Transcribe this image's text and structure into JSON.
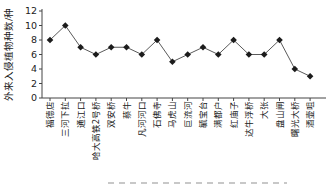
{
  "chart_data": {
    "type": "line",
    "title": "",
    "xlabel": "",
    "ylabel": "外来入侵植物种数/种",
    "categories": [
      "福德店",
      "三河下拉",
      "通江口",
      "哈大高铁2号桥",
      "双安桥",
      "蔡牛",
      "凡河河口",
      "石佛寺",
      "马虎山",
      "巨流河",
      "毓宝台",
      "满都户",
      "红庙子",
      "达牛浮桥",
      "大张",
      "盘山闸",
      "曙光大桥",
      "酒壶咀"
    ],
    "values": [
      8,
      10,
      7,
      6,
      7,
      7,
      6,
      8,
      5,
      6,
      7,
      6,
      8,
      6,
      6,
      8,
      4,
      3
    ],
    "yticks": [
      0,
      2,
      4,
      6,
      8,
      10,
      12
    ],
    "ylim": [
      0,
      12
    ],
    "grid": false,
    "legend": "none",
    "marker": "diamond",
    "colors": {
      "line": "#5a5a5a",
      "marker": "#1c1c1c",
      "axis": "#444444",
      "tick_text": "#222222",
      "caption_remnant": "#c8c8c8"
    }
  }
}
